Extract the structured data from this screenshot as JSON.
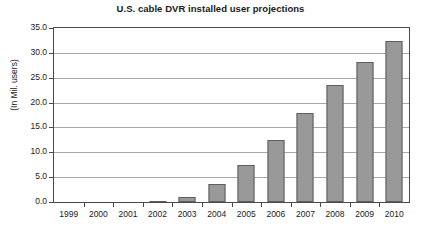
{
  "chart_data": {
    "type": "bar",
    "title": "U.S. cable DVR installed user projections",
    "xlabel": "",
    "ylabel": "(In Mil. users)",
    "categories": [
      "1999",
      "2000",
      "2001",
      "2002",
      "2003",
      "2004",
      "2005",
      "2006",
      "2007",
      "2008",
      "2009",
      "2010"
    ],
    "values": [
      0.0,
      0.0,
      0.0,
      0.2,
      1.0,
      3.6,
      7.5,
      12.5,
      18.0,
      23.5,
      28.2,
      32.4
    ],
    "series": [
      {
        "name": "U.S. cable DVR installed users",
        "values": [
          0.0,
          0.0,
          0.0,
          0.2,
          1.0,
          3.6,
          7.5,
          12.5,
          18.0,
          23.5,
          28.2,
          32.4
        ]
      }
    ],
    "ylim": [
      0.0,
      35.0
    ],
    "ytick_labels": [
      "0.0",
      "5.0",
      "10.0",
      "15.0",
      "20.0",
      "25.0",
      "30.0",
      "35.0"
    ],
    "ytick_values": [
      0.0,
      5.0,
      10.0,
      15.0,
      20.0,
      25.0,
      30.0,
      35.0
    ],
    "grid": true,
    "legend": false,
    "legend_position": "none",
    "bar_color": "#999999",
    "bar_border_color": "#5e5e5e",
    "grid_color": "#a8a8a8",
    "axis_color": "#4a4a4a",
    "background_color": "#ffffff",
    "text_color": "#1a1a1a"
  }
}
